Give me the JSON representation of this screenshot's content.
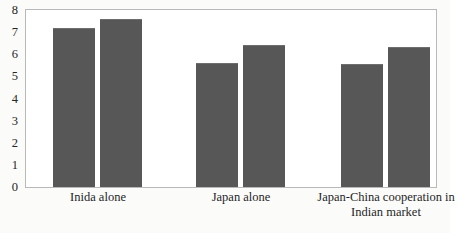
{
  "chart_data": {
    "type": "bar",
    "title": "",
    "subtitle": "",
    "xlabel": "",
    "ylabel": "",
    "ylim": [
      0,
      8
    ],
    "ytick_labels": [
      "8",
      "7",
      "6",
      "5",
      "4",
      "3",
      "2",
      "1",
      "0"
    ],
    "yticks": [
      8,
      7,
      6,
      5,
      4,
      3,
      2,
      1,
      0
    ],
    "grid": false,
    "legend": false,
    "legend_position": "none",
    "categories": [
      "Inida alone",
      "Japan alone",
      "Japan-China cooperation in Indian market"
    ],
    "category_lines": [
      [
        "Inida alone"
      ],
      [
        "Japan alone"
      ],
      [
        "Japan-China cooperation in",
        "Indian market"
      ]
    ],
    "series": [
      {
        "name": "Series 1",
        "values": [
          7.2,
          5.6,
          5.55
        ]
      },
      {
        "name": "Series 2",
        "values": [
          7.6,
          6.4,
          6.35
        ]
      }
    ],
    "bar_color": "#575757",
    "plot_background": "#ffffff",
    "plot_border_color": "#b9b9b9",
    "page_background": "#fbfbfa"
  },
  "geometry": {
    "bars": [
      {
        "name": "bar-inida-alone-1",
        "left": 27,
        "width": 42,
        "value": 7.2
      },
      {
        "name": "bar-inida-alone-2",
        "left": 74,
        "width": 42,
        "value": 7.6
      },
      {
        "name": "bar-japan-alone-1",
        "left": 170,
        "width": 42,
        "value": 5.6
      },
      {
        "name": "bar-japan-alone-2",
        "left": 217,
        "width": 42,
        "value": 6.4
      },
      {
        "name": "bar-japan-china-cooperation-1",
        "left": 315,
        "width": 42,
        "value": 5.55
      },
      {
        "name": "bar-japan-china-cooperation-2",
        "left": 362,
        "width": 42,
        "value": 6.35
      }
    ],
    "categories": [
      {
        "center": 73,
        "width": 150
      },
      {
        "center": 216,
        "width": 150
      },
      {
        "center": 361,
        "width": 180
      }
    ]
  }
}
